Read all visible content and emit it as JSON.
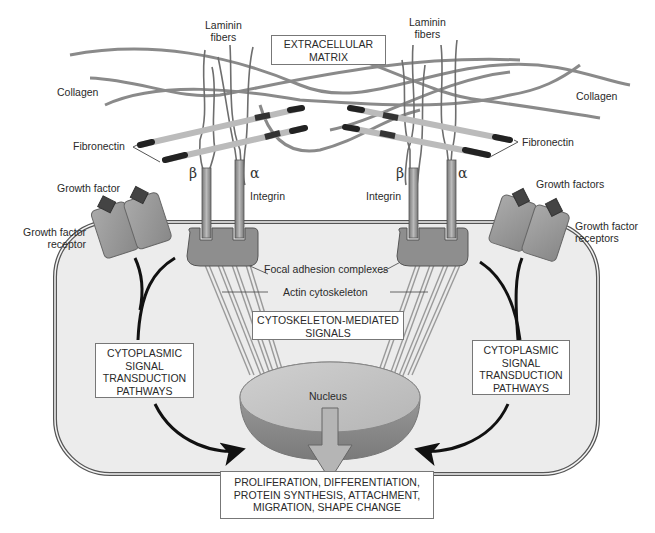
{
  "labels": {
    "laminin_left": [
      "Laminin",
      "fibers"
    ],
    "laminin_right": [
      "Laminin",
      "fibers"
    ],
    "ecm_box": [
      "EXTRACELLULAR",
      "MATRIX"
    ],
    "collagen_left": "Collagen",
    "collagen_right": "Collagen",
    "fibronectin_left": "Fibronectin",
    "fibronectin_right": "Fibronectin",
    "beta_left": "β",
    "alpha_left": "α",
    "beta_right": "β",
    "alpha_right": "α",
    "integrin_left": "Integrin",
    "integrin_right": "Integrin",
    "growth_factor_left": "Growth factor",
    "growth_factor_receptor_left": [
      "Growth factor",
      "receptor"
    ],
    "growth_factors_right": "Growth factors",
    "growth_factor_receptors_right": [
      "Growth factor",
      "receptors"
    ],
    "focal_adhesion": "Focal adhesion complexes",
    "actin": "Actin cytoskeleton",
    "cytoskeleton_box": [
      "CYTOSKELETON-MEDIATED",
      "SIGNALS"
    ],
    "cytoplasmic_left": [
      "CYTOPLASMIC",
      "SIGNAL",
      "TRANSDUCTION",
      "PATHWAYS"
    ],
    "cytoplasmic_right": [
      "CYTOPLASMIC",
      "SIGNAL",
      "TRANSDUCTION",
      "PATHWAYS"
    ],
    "nucleus": "Nucleus",
    "outcome_box": [
      "PROLIFERATION, DIFFERENTIATION,",
      "PROTEIN SYNTHESIS, ATTACHMENT,",
      "MIGRATION, SHAPE CHANGE"
    ]
  },
  "colors": {
    "cell_fill": "#ececec",
    "membrane": "#555555",
    "focal_adhesion": "#8e8e8e",
    "receptor": "#999999",
    "nucleus_top": "#bdbdbd",
    "nucleus_bottom": "#8a8a8a",
    "fiber": "#8a8a8a",
    "arrow": "#111111"
  }
}
